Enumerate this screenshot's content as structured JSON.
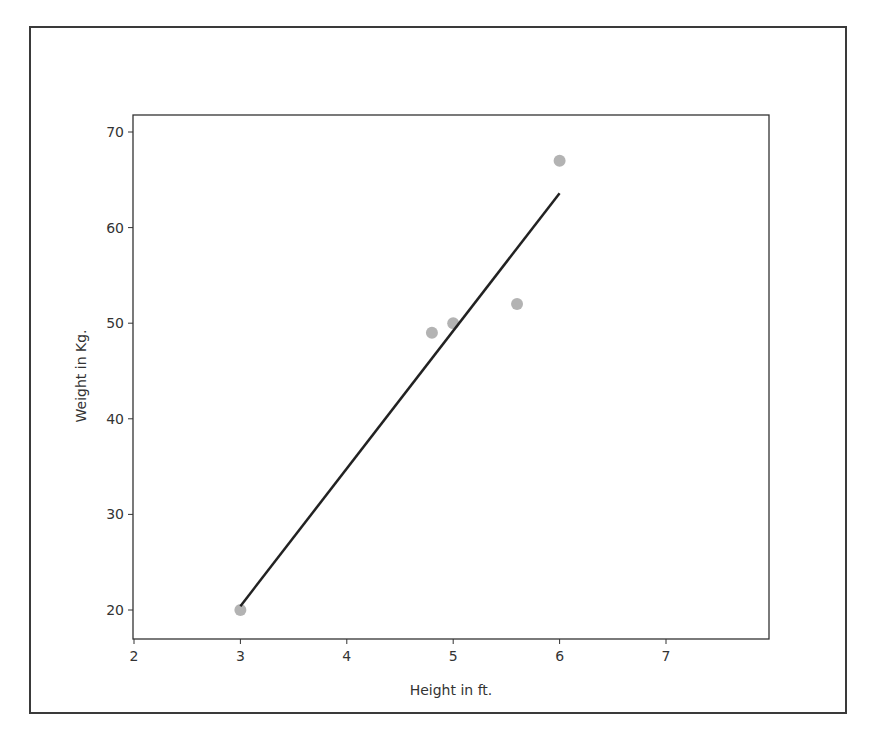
{
  "chart_data": {
    "type": "scatter",
    "title": "",
    "xlabel": "Height in ft.",
    "ylabel": "Weight in Kg.",
    "xlim": [
      1.99,
      7.96
    ],
    "ylim": [
      17.1,
      72.3
    ],
    "xticks": [
      2,
      3,
      4,
      5,
      6,
      7
    ],
    "yticks": [
      20,
      30,
      40,
      50,
      60,
      70
    ],
    "grid": false,
    "legend": null,
    "series": [
      {
        "name": "data points",
        "kind": "scatter",
        "color": "#b3b3b3",
        "x": [
          3.0,
          4.8,
          5.0,
          5.6,
          6.0
        ],
        "y": [
          20,
          49,
          50,
          52,
          67
        ]
      },
      {
        "name": "regression line",
        "kind": "line",
        "color": "#222222",
        "x": [
          3.0,
          6.0
        ],
        "y": [
          20.4,
          63.6
        ]
      }
    ]
  }
}
